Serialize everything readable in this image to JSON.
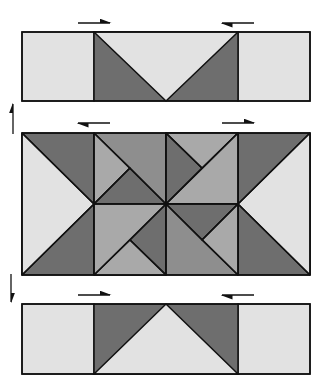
{
  "diagram": {
    "colors": {
      "light": "#e2e2e2",
      "medium": "#a9a9a9",
      "mediumDark": "#8e8e8e",
      "dark": "#6e6e6e",
      "stroke": "#111111"
    },
    "rows": [
      {
        "name": "top-row",
        "pressing_arrows": [
          "right",
          "left"
        ]
      },
      {
        "name": "middle-row",
        "pressing_arrows": [
          "left",
          "right"
        ]
      },
      {
        "name": "bottom-row",
        "pressing_arrows": [
          "right",
          "left"
        ]
      }
    ],
    "joining_arrows": [
      "up",
      "down"
    ]
  }
}
